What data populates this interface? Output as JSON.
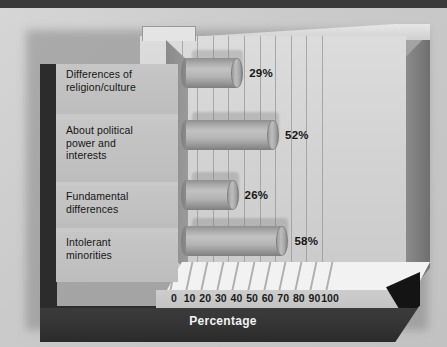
{
  "chart_data": {
    "type": "bar",
    "orientation": "horizontal",
    "style": "3d-cylinder",
    "title": "",
    "xlabel": "Percentage",
    "ylabel": "",
    "xlim": [
      0,
      100
    ],
    "xticks": [
      "0",
      "10",
      "20",
      "30",
      "40",
      "50",
      "60",
      "70",
      "80",
      "90",
      "100"
    ],
    "grid": true,
    "grid_axis": "x",
    "legend": "none",
    "categories": [
      "Differences of\nreligion/culture",
      "About political\npower and\ninterests",
      "Fundamental\ndifferences",
      "Intolerant\nminorities"
    ],
    "values": [
      29,
      52,
      26,
      58
    ],
    "data_labels": [
      "29%",
      "52%",
      "26%",
      "58%"
    ],
    "series": [
      {
        "name": "Percentage",
        "values": [
          29,
          52,
          26,
          58
        ]
      }
    ]
  },
  "axis": {
    "title": "Percentage",
    "ticks": [
      {
        "label": "0",
        "value": 0
      },
      {
        "label": "10",
        "value": 10
      },
      {
        "label": "20",
        "value": 20
      },
      {
        "label": "30",
        "value": 30
      },
      {
        "label": "40",
        "value": 40
      },
      {
        "label": "50",
        "value": 50
      },
      {
        "label": "60",
        "value": 60
      },
      {
        "label": "70",
        "value": 70
      },
      {
        "label": "80",
        "value": 80
      },
      {
        "label": "90",
        "value": 90
      },
      {
        "label": "100",
        "value": 100
      }
    ]
  },
  "rows": [
    {
      "label": "Differences of\nreligion/culture",
      "value": 29,
      "data_label": "29%"
    },
    {
      "label": "About political\npower and\ninterests",
      "value": 52,
      "data_label": "52%"
    },
    {
      "label": "Fundamental\ndifferences",
      "value": 26,
      "data_label": "26%"
    },
    {
      "label": "Intolerant\nminorities",
      "value": 58,
      "data_label": "58%"
    }
  ],
  "colors": {
    "page_background": "#cfcfcf",
    "plot_wall": "#d4d4d4",
    "bar_light": "#c2c2c2",
    "bar_mid": "#a9a9a9",
    "bar_dark": "#7e7e7e",
    "label_panel": "#c2c2c2",
    "base_slab": "#333333",
    "axis_title_text": "#f2f2f2",
    "text": "#161616",
    "gridline": "#969696",
    "floor": "#f2f2f2",
    "left_border_dark": "#2c2c2c"
  }
}
